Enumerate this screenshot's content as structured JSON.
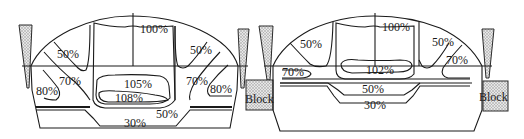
{
  "figure": {
    "left_panel": {
      "labels": {
        "top_center": "100%",
        "upper_left": "50%",
        "upper_right": "50%",
        "mid_left": "70%",
        "mid_right": "70%",
        "outer_left": "80%",
        "outer_right": "80%",
        "core_upper": "105%",
        "core_lower": "108%",
        "bottom_right": "50%",
        "bottom": "30%"
      }
    },
    "right_panel": {
      "labels": {
        "top_center": "100%",
        "upper_left": "50%",
        "upper_right": "50%",
        "mid_left": "70%",
        "mid_right": "70%",
        "core": "102%",
        "lower": "50%",
        "bottom": "30%",
        "block_left": "Block",
        "block_right": "Block"
      }
    },
    "colors": {
      "line": "#1a1a1a",
      "hatch_fill": "#cfcfcf",
      "background": "#ffffff"
    }
  }
}
